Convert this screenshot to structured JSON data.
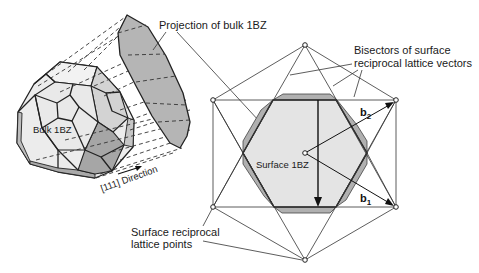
{
  "labels": {
    "projection": "Projection of bulk 1BZ",
    "bisectors_line1": "Bisectors of surface",
    "bisectors_line2": "reciprocal lattice vectors",
    "bulk": "Bulk 1BZ",
    "surface_bz": "Surface 1BZ",
    "direction": "[111] Direction",
    "lattice_points_line1": "Surface reciprocal",
    "lattice_points_line2": "lattice points",
    "b1_base": "b",
    "b1_sub": "1",
    "b2_base": "b",
    "b2_sub": "2"
  },
  "colors": {
    "background": "#ffffff",
    "surface_bz_fill": "#e4e4e4",
    "projection_fill": "#b4b4b4",
    "bulk_light": "#ececec",
    "bulk_mid": "#d2d2d2",
    "bulk_dark": "#a8a8a8",
    "line": "#222222"
  },
  "lattice_points": [
    {
      "name": "top",
      "x": 305,
      "y": 45
    },
    {
      "name": "upper-left",
      "x": 213,
      "y": 100
    },
    {
      "name": "upper-right",
      "x": 396,
      "y": 100
    },
    {
      "name": "lower-left",
      "x": 213,
      "y": 207
    },
    {
      "name": "lower-right",
      "x": 396,
      "y": 207
    },
    {
      "name": "bottom",
      "x": 305,
      "y": 260
    },
    {
      "name": "center",
      "x": 305,
      "y": 153
    }
  ]
}
